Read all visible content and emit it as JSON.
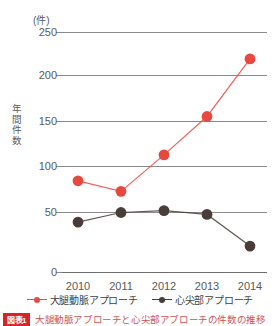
{
  "chart_data": {
    "type": "line",
    "title": "",
    "unit_label": "(件)",
    "xlabel": "",
    "ylabel": "年間件数",
    "categories": [
      "2010",
      "2011",
      "2012",
      "2013",
      "2014"
    ],
    "yticks": [
      "0",
      "50",
      "100",
      "150",
      "200",
      "250"
    ],
    "ylim": [
      0,
      250
    ],
    "grid": true,
    "legend_position": "bottom",
    "series": [
      {
        "name": "大腿動脈アプローチ",
        "color": "#e8493f",
        "values": [
          95,
          84,
          122,
          162,
          222
        ]
      },
      {
        "name": "心尖部アプローチ",
        "color": "#4a3c38",
        "values": [
          52,
          62,
          64,
          60,
          27
        ]
      }
    ]
  },
  "legend": [
    {
      "label": "大腿動脈アプローチ",
      "color": "#e8493f"
    },
    {
      "label": "心尖部アプローチ",
      "color": "#4a3c38"
    }
  ],
  "caption": {
    "badge": "図表1",
    "badge_color": "#d8232a",
    "text": "大腿動脈アプローチと心尖部アプローチの件数の推移"
  }
}
